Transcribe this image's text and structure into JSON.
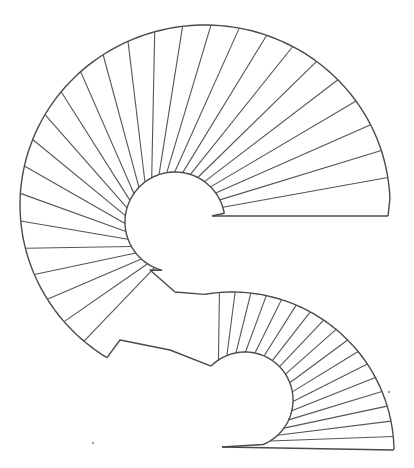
{
  "diagram": {
    "type": "line-drawing",
    "background": "#ffffff",
    "stroke_color": "#4a4a4a",
    "upper_flight": {
      "outer_center": [
        180,
        215
      ],
      "outer_radius": 165,
      "outer_start_deg": 0,
      "outer_end_deg": 235,
      "inner_center": [
        180,
        215
      ],
      "inner_radius": 50,
      "inner_start_deg": 0,
      "inner_end_deg": 235,
      "tread_count": 27,
      "landing_top_right": [
        388,
        216
      ],
      "landing_inner_right": [
        212,
        216
      ]
    },
    "lower_flight": {
      "outer_center": [
        230,
        448
      ],
      "outer_radius": 162,
      "outer_start_deg": 0,
      "outer_end_deg": 120,
      "inner_center": [
        235,
        395
      ],
      "inner_radius": 47,
      "tread_count": 18,
      "landing_bottom_right": [
        393,
        450
      ],
      "landing_inner_left": [
        222,
        447
      ]
    },
    "specks": [
      [
        389,
        392
      ],
      [
        93,
        443
      ]
    ]
  }
}
